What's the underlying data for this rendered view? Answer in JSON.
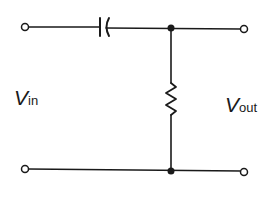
{
  "diagram": {
    "type": "RC high-pass filter circuit",
    "labels": {
      "input_main": "V",
      "input_sub": "in",
      "output_main": "V",
      "output_sub": "out"
    },
    "components": [
      {
        "type": "capacitor",
        "position": "series, top wire"
      },
      {
        "type": "resistor",
        "position": "shunt, between top and bottom wires"
      }
    ],
    "colors": {
      "line": "#1a1a1a",
      "background": "#ffffff"
    }
  }
}
